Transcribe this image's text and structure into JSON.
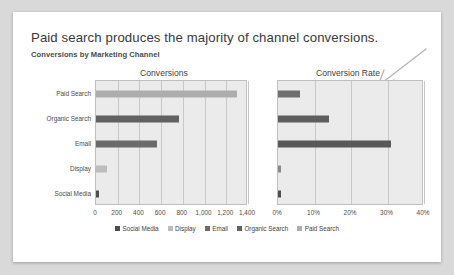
{
  "header": {
    "title": "Paid search produces the majority of channel conversions.",
    "subtitle": "Conversions by Marketing Channel"
  },
  "annotation": {
    "arrow_name": "hand-drawn-arrow",
    "color": "#b5b5b5",
    "points_to": "Conversion Rate"
  },
  "legend": {
    "position": "bottom-center",
    "entries": [
      {
        "label": "Social Media",
        "color": "#4f4f4f"
      },
      {
        "label": "Display",
        "color": "#bdbdbd"
      },
      {
        "label": "Email",
        "color": "#6b6b6b"
      },
      {
        "label": "Organic Search",
        "color": "#616161"
      },
      {
        "label": "Paid Search",
        "color": "#adadad"
      }
    ]
  },
  "chart_data": [
    {
      "type": "bar",
      "orientation": "horizontal",
      "title": "Conversions",
      "xlabel": "",
      "ylabel": "",
      "categories": [
        "Paid Search",
        "Organic Search",
        "Email",
        "Display",
        "Social Media"
      ],
      "values": [
        1300,
        760,
        560,
        100,
        30
      ],
      "colors": [
        "#adadad",
        "#616161",
        "#6b6b6b",
        "#bdbdbd",
        "#4f4f4f"
      ],
      "xlim": [
        0,
        1400
      ],
      "xticks": [
        0,
        200,
        400,
        600,
        800,
        1000,
        1200,
        1400
      ],
      "xticklabels": [
        "0",
        "200",
        "400",
        "600",
        "800",
        "1,000",
        "1,200",
        "1,400"
      ],
      "grid": true
    },
    {
      "type": "bar",
      "orientation": "horizontal",
      "title": "Conversion Rate",
      "xlabel": "",
      "ylabel": "",
      "categories": [
        "Paid Search",
        "Organic Search",
        "Email",
        "Display",
        "Social Media"
      ],
      "values": [
        6.0,
        14.0,
        31.0,
        0.6,
        0.8
      ],
      "colors": [
        "#6f6f6f",
        "#5e5e5e",
        "#585858",
        "#8a8a8a",
        "#4f4f4f"
      ],
      "xlim": [
        0,
        40
      ],
      "xticks": [
        0,
        10,
        20,
        30,
        40
      ],
      "xticklabels": [
        "0%",
        "10%",
        "20%",
        "30%",
        "40%"
      ],
      "grid": true
    }
  ]
}
